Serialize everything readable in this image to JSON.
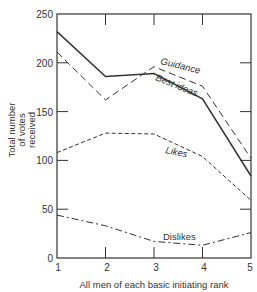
{
  "chart_data": {
    "type": "line",
    "title": "",
    "xlabel": "All men of each basic initiating rank",
    "ylabel_lines": [
      "Total number",
      "of votes",
      "received"
    ],
    "x": [
      1,
      2,
      3,
      4,
      5
    ],
    "xlim": [
      1,
      5
    ],
    "ylim": [
      0,
      250
    ],
    "yticks": [
      0,
      50,
      100,
      150,
      200,
      250
    ],
    "xticks": [
      1,
      2,
      3,
      4,
      5
    ],
    "grid": false,
    "legend": "inline labels",
    "series": [
      {
        "name": "Best ideas",
        "style": "solid",
        "values": [
          232,
          186,
          189,
          163,
          84
        ]
      },
      {
        "name": "Guidance",
        "style": "long-dash",
        "values": [
          211,
          162,
          196,
          176,
          102
        ]
      },
      {
        "name": "Likes",
        "style": "short-dash",
        "values": [
          108,
          128,
          127,
          104,
          59
        ]
      },
      {
        "name": "Dislikes",
        "style": "dash-dot",
        "values": [
          44,
          33,
          17,
          13,
          26
        ]
      }
    ]
  },
  "labels": {
    "ytick": [
      "0",
      "50",
      "100",
      "150",
      "200",
      "250"
    ],
    "xtick": [
      "1",
      "2",
      "3",
      "4",
      "5"
    ],
    "ylabel_1": "Total number",
    "ylabel_2": "of votes",
    "ylabel_3": "received",
    "xlabel": "All men of each basic initiating rank",
    "series_guidance": "Guidance",
    "series_best_ideas": "Best ideas",
    "series_likes": "Likes",
    "series_dislikes": "Dislikes"
  },
  "colors": {
    "ink": "#333333",
    "background": "#ffffff"
  }
}
